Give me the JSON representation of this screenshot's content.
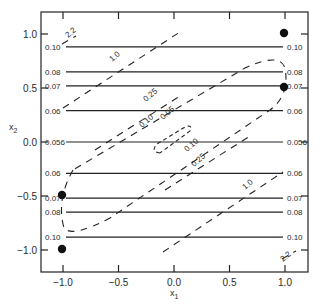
{
  "chart_data": {
    "type": "contour",
    "title": "",
    "xlabel": "x1",
    "ylabel": "x2",
    "xlim": [
      -1.2,
      1.2
    ],
    "ylim": [
      -1.2,
      1.2
    ],
    "x_ticks": [
      -1.0,
      -0.5,
      0.0,
      0.5,
      1.0
    ],
    "x_tick_labels": [
      "−1.0",
      "−0.5",
      "0.0",
      "0.5",
      "1.0"
    ],
    "y_ticks": [
      1.0,
      0.5,
      0.0,
      -0.5,
      -1.0
    ],
    "y_tick_labels": [
      "1.0",
      "0.5",
      "0.0",
      "−0.5",
      "−1.0"
    ],
    "grid": false,
    "legend": null,
    "solid_contours": {
      "style": "solid horizontal lines",
      "levels": [
        {
          "y": 0.88,
          "label": "0.10"
        },
        {
          "y": 0.65,
          "label": "0.08"
        },
        {
          "y": 0.52,
          "label": "0.07"
        },
        {
          "y": 0.29,
          "label": "0.06"
        },
        {
          "y": 0.0,
          "label": "0.056"
        },
        {
          "y": -0.29,
          "label": "0.06"
        },
        {
          "y": -0.52,
          "label": "0.07"
        },
        {
          "y": -0.65,
          "label": "0.08"
        },
        {
          "y": -0.88,
          "label": "0.10"
        }
      ]
    },
    "dashed_contours": {
      "style": "dashed diagonal lines / ellipses",
      "levels": [
        "2.2",
        "1.0",
        "0.25",
        "0.10",
        "0.05"
      ]
    },
    "points": [
      {
        "x": 1.0,
        "y": 1.0
      },
      {
        "x": 1.0,
        "y": 0.5
      },
      {
        "x": -1.0,
        "y": -0.5
      },
      {
        "x": -1.0,
        "y": -1.0
      }
    ],
    "annotations": [
      "2.2",
      "1.0",
      "0.25",
      "0.10",
      "0.05",
      "0.10",
      "0.25",
      "1.0",
      "2.2"
    ]
  },
  "labels": {
    "xlabel": "x",
    "xlabel_sub": "1",
    "ylabel": "x",
    "ylabel_sub": "2"
  }
}
